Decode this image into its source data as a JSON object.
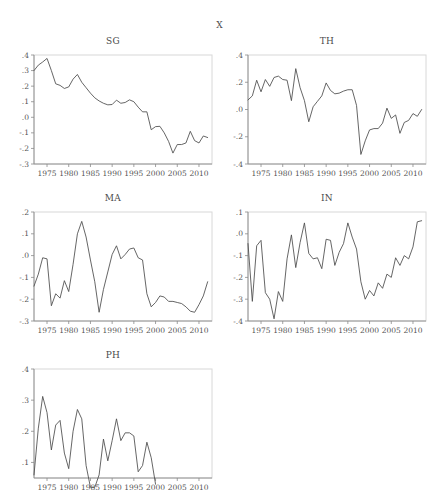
{
  "figure": {
    "overall_title": "X",
    "x_axis_years": [
      "1975",
      "1980",
      "1985",
      "1990",
      "1995",
      "2000",
      "2005",
      "2010"
    ],
    "line_color": "#4a4a4a",
    "frame_color": "#d8d8d8",
    "axis_color": "#8a8a8a"
  },
  "panels": [
    {
      "id": "SG",
      "title": "SG"
    },
    {
      "id": "TH",
      "title": "TH"
    },
    {
      "id": "MA",
      "title": "MA"
    },
    {
      "id": "IN",
      "title": "IN"
    },
    {
      "id": "PH",
      "title": "PH"
    }
  ],
  "chart_data": [
    {
      "type": "line",
      "title": "SG",
      "xlabel": "",
      "ylabel": "",
      "xlim": [
        1972,
        2013
      ],
      "ylim": [
        -0.3,
        0.4
      ],
      "ytick_labels": [
        ".4",
        ".3",
        ".2",
        ".1",
        ".0",
        "-.1",
        "-.2",
        "-.3"
      ],
      "ytick_values": [
        0.4,
        0.3,
        0.2,
        0.1,
        0.0,
        -0.1,
        -0.2,
        -0.3
      ],
      "xtick_labels": [
        "1975",
        "1980",
        "1985",
        "1990",
        "1995",
        "2000",
        "2005",
        "2010"
      ],
      "xtick_values": [
        1975,
        1980,
        1985,
        1990,
        1995,
        2000,
        2005,
        2010
      ],
      "grid": false,
      "legend": "none",
      "x": [
        1972,
        1973,
        1974,
        1975,
        1976,
        1977,
        1978,
        1979,
        1980,
        1981,
        1982,
        1983,
        1984,
        1985,
        1986,
        1987,
        1988,
        1989,
        1990,
        1991,
        1992,
        1993,
        1994,
        1995,
        1996,
        1997,
        1998,
        1999,
        2000,
        2001,
        2002,
        2003,
        2004,
        2005,
        2006,
        2007,
        2008,
        2009,
        2010,
        2011,
        2012
      ],
      "values": [
        0.3,
        0.335,
        0.355,
        0.378,
        0.3,
        0.215,
        0.205,
        0.185,
        0.195,
        0.245,
        0.275,
        0.225,
        0.19,
        0.155,
        0.125,
        0.105,
        0.09,
        0.08,
        0.082,
        0.11,
        0.09,
        0.095,
        0.112,
        0.1,
        0.065,
        0.035,
        0.035,
        -0.08,
        -0.06,
        -0.058,
        -0.1,
        -0.155,
        -0.23,
        -0.175,
        -0.175,
        -0.165,
        -0.09,
        -0.15,
        -0.165,
        -0.12,
        -0.13
      ]
    },
    {
      "type": "line",
      "title": "TH",
      "xlabel": "",
      "ylabel": "",
      "xlim": [
        1972,
        2013
      ],
      "ylim": [
        -0.4,
        0.4
      ],
      "ytick_labels": [
        ".4",
        ".2",
        ".0",
        "-.2",
        "-.4"
      ],
      "ytick_values": [
        0.4,
        0.2,
        0.0,
        -0.2,
        -0.4
      ],
      "xtick_labels": [
        "1975",
        "1980",
        "1985",
        "1990",
        "1995",
        "2000",
        "2005",
        "2010"
      ],
      "xtick_values": [
        1975,
        1980,
        1985,
        1990,
        1995,
        2000,
        2005,
        2010
      ],
      "grid": false,
      "legend": "none",
      "x": [
        1972,
        1973,
        1974,
        1975,
        1976,
        1977,
        1978,
        1979,
        1980,
        1981,
        1982,
        1983,
        1984,
        1985,
        1986,
        1987,
        1988,
        1989,
        1990,
        1991,
        1992,
        1993,
        1994,
        1995,
        1996,
        1997,
        1998,
        1999,
        2000,
        2001,
        2002,
        2003,
        2004,
        2005,
        2006,
        2007,
        2008,
        2009,
        2010,
        2011,
        2012
      ],
      "values": [
        0.07,
        0.1,
        0.215,
        0.13,
        0.22,
        0.17,
        0.235,
        0.245,
        0.22,
        0.215,
        0.065,
        0.3,
        0.16,
        0.065,
        -0.09,
        0.02,
        0.06,
        0.1,
        0.195,
        0.14,
        0.115,
        0.12,
        0.135,
        0.145,
        0.145,
        0.03,
        -0.33,
        -0.23,
        -0.15,
        -0.14,
        -0.14,
        -0.1,
        0.01,
        -0.065,
        -0.04,
        -0.175,
        -0.095,
        -0.08,
        -0.03,
        -0.05,
        0.0
      ]
    },
    {
      "type": "line",
      "title": "MA",
      "xlabel": "",
      "ylabel": "",
      "xlim": [
        1972,
        2013
      ],
      "ylim": [
        -0.3,
        0.2
      ],
      "ytick_labels": [
        ".2",
        ".1",
        ".0",
        "-.1",
        "-.2",
        "-.3"
      ],
      "ytick_values": [
        0.2,
        0.1,
        0.0,
        -0.1,
        -0.2,
        -0.3
      ],
      "xtick_labels": [
        "1975",
        "1980",
        "1985",
        "1990",
        "1995",
        "2000",
        "2005",
        "2010"
      ],
      "xtick_values": [
        1975,
        1980,
        1985,
        1990,
        1995,
        2000,
        2005,
        2010
      ],
      "grid": false,
      "legend": "none",
      "x": [
        1972,
        1973,
        1974,
        1975,
        1976,
        1977,
        1978,
        1979,
        1980,
        1981,
        1982,
        1983,
        1984,
        1985,
        1986,
        1987,
        1988,
        1989,
        1990,
        1991,
        1992,
        1993,
        1994,
        1995,
        1996,
        1997,
        1998,
        1999,
        2000,
        2001,
        2002,
        2003,
        2004,
        2005,
        2006,
        2007,
        2008,
        2009,
        2010,
        2011,
        2012
      ],
      "values": [
        -0.14,
        -0.085,
        -0.01,
        -0.015,
        -0.23,
        -0.175,
        -0.195,
        -0.115,
        -0.165,
        -0.04,
        0.1,
        0.157,
        0.085,
        -0.02,
        -0.12,
        -0.26,
        -0.155,
        -0.075,
        0.005,
        0.045,
        -0.015,
        0.005,
        0.03,
        0.035,
        -0.01,
        -0.02,
        -0.175,
        -0.235,
        -0.215,
        -0.185,
        -0.19,
        -0.21,
        -0.21,
        -0.215,
        -0.22,
        -0.235,
        -0.255,
        -0.26,
        -0.225,
        -0.185,
        -0.12
      ]
    },
    {
      "type": "line",
      "title": "IN",
      "xlabel": "",
      "ylabel": "",
      "xlim": [
        1972,
        2013
      ],
      "ylim": [
        -0.4,
        0.1
      ],
      "ytick_labels": [
        ".1",
        ".0",
        "-.1",
        "-.2",
        "-.3",
        "-.4"
      ],
      "ytick_values": [
        0.1,
        0.0,
        -0.1,
        -0.2,
        -0.3,
        -0.4
      ],
      "xtick_labels": [
        "1975",
        "1980",
        "1985",
        "1990",
        "1995",
        "2000",
        "2005",
        "2010"
      ],
      "xtick_values": [
        1975,
        1980,
        1985,
        1990,
        1995,
        2000,
        2005,
        2010
      ],
      "grid": false,
      "legend": "none",
      "x": [
        1972,
        1973,
        1974,
        1975,
        1976,
        1977,
        1978,
        1979,
        1980,
        1981,
        1982,
        1983,
        1984,
        1985,
        1986,
        1987,
        1988,
        1989,
        1990,
        1991,
        1992,
        1993,
        1994,
        1995,
        1996,
        1997,
        1998,
        1999,
        2000,
        2001,
        2002,
        2003,
        2004,
        2005,
        2006,
        2007,
        2008,
        2009,
        2010,
        2011,
        2012
      ],
      "values": [
        -0.045,
        -0.31,
        -0.055,
        -0.03,
        -0.27,
        -0.3,
        -0.39,
        -0.265,
        -0.31,
        -0.115,
        -0.005,
        -0.155,
        -0.04,
        0.05,
        -0.09,
        -0.115,
        -0.11,
        -0.16,
        -0.025,
        -0.03,
        -0.145,
        -0.085,
        -0.045,
        0.05,
        -0.015,
        -0.07,
        -0.22,
        -0.3,
        -0.26,
        -0.285,
        -0.225,
        -0.25,
        -0.185,
        -0.2,
        -0.11,
        -0.145,
        -0.1,
        -0.115,
        -0.06,
        0.055,
        0.06
      ]
    },
    {
      "type": "line",
      "title": "PH",
      "xlabel": "",
      "ylabel": "",
      "xlim": [
        1972,
        2013
      ],
      "ylim": [
        0.05,
        0.4
      ],
      "ytick_labels": [
        ".4",
        ".3",
        ".2",
        ".1"
      ],
      "ytick_values": [
        0.4,
        0.3,
        0.2,
        0.1
      ],
      "xtick_labels": [
        "1975",
        "1980",
        "1985",
        "1990",
        "1995",
        "2000",
        "2005",
        "2010"
      ],
      "xtick_values": [
        1975,
        1980,
        1985,
        1990,
        1995,
        2000,
        2005,
        2010
      ],
      "grid": false,
      "legend": "none",
      "clipped": true,
      "x": [
        1972,
        1973,
        1974,
        1975,
        1976,
        1977,
        1978,
        1979,
        1980,
        1981,
        1982,
        1983,
        1984,
        1985,
        1986,
        1987,
        1988,
        1989,
        1990,
        1991,
        1992,
        1993,
        1994,
        1995,
        1996,
        1997,
        1998,
        1999,
        2000
      ],
      "values": [
        0.06,
        0.21,
        0.312,
        0.26,
        0.14,
        0.22,
        0.235,
        0.13,
        0.08,
        0.2,
        0.27,
        0.24,
        0.09,
        0.02,
        0.02,
        0.06,
        0.175,
        0.105,
        0.17,
        0.24,
        0.17,
        0.195,
        0.195,
        0.185,
        0.07,
        0.09,
        0.165,
        0.115,
        0.03
      ]
    }
  ]
}
